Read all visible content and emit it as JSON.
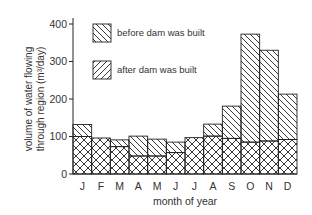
{
  "chart_data": {
    "type": "bar",
    "title": "",
    "xlabel": "month of year",
    "ylabel_line1": "volume of water flowing",
    "ylabel_line2": "through region (m³/day)",
    "ylim": [
      0,
      400
    ],
    "yticks": [
      0,
      100,
      200,
      300,
      400
    ],
    "categories": [
      "J",
      "F",
      "M",
      "A",
      "M",
      "J",
      "J",
      "A",
      "S",
      "O",
      "N",
      "D"
    ],
    "series": [
      {
        "name": "before dam was built",
        "pattern": "backslash-hatch",
        "values": [
          132,
          96,
          91,
          101,
          93,
          85,
          97,
          133,
          181,
          373,
          330,
          213
        ]
      },
      {
        "name": "after dam was built",
        "pattern": "slash-hatch",
        "values": [
          100,
          96,
          73,
          48,
          48,
          57,
          97,
          101,
          95,
          85,
          88,
          92
        ]
      }
    ],
    "overlap_pattern": "cross-hatch",
    "legend": {
      "position": "upper-left-inside",
      "entries": [
        "before dam was built",
        "after dam was built"
      ]
    },
    "grid": false
  }
}
